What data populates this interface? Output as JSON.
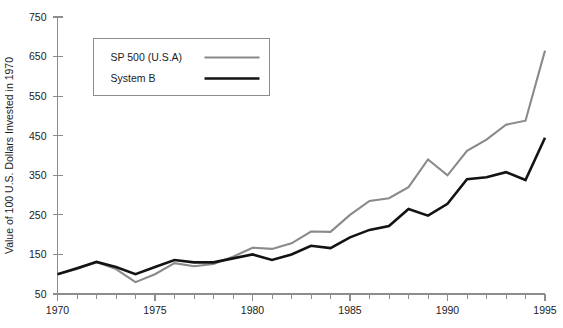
{
  "chart_data": {
    "type": "line",
    "title": "",
    "xlabel": "",
    "ylabel": "Value of 100 U.S. Dollars Invested in 1970",
    "xlim": [
      1970,
      1995
    ],
    "ylim": [
      50,
      750
    ],
    "ytick_values": [
      50,
      150,
      250,
      350,
      450,
      550,
      650,
      750
    ],
    "ytick_labels": [
      "50",
      "150",
      "250",
      "350",
      "450",
      "550",
      "650",
      "750"
    ],
    "xtick_values": [
      1970,
      1975,
      1980,
      1985,
      1990,
      1995
    ],
    "xtick_labels": [
      "1970",
      "1975",
      "1980",
      "1985",
      "1990",
      "1995"
    ],
    "x_minor_tick_step": 1,
    "grid": false,
    "legend_position": "upper-left-inset",
    "x": [
      1970,
      1971,
      1972,
      1973,
      1974,
      1975,
      1976,
      1977,
      1978,
      1979,
      1980,
      1981,
      1982,
      1983,
      1984,
      1985,
      1986,
      1987,
      1988,
      1989,
      1990,
      1991,
      1992,
      1993,
      1994,
      1995
    ],
    "series": [
      {
        "name": "SP 500 (U.S.A)",
        "color": "#8a8a8a",
        "line_width": 2.1,
        "values": [
          100,
          113,
          131,
          113,
          80,
          100,
          128,
          120,
          126,
          144,
          167,
          164,
          178,
          208,
          207,
          250,
          285,
          292,
          320,
          390,
          350,
          412,
          440,
          478,
          488,
          665
        ]
      },
      {
        "name": "System B",
        "color": "#131313",
        "line_width": 2.6,
        "values": [
          100,
          115,
          131,
          118,
          100,
          118,
          136,
          130,
          130,
          140,
          150,
          136,
          150,
          172,
          166,
          193,
          212,
          222,
          265,
          248,
          278,
          340,
          345,
          358,
          338,
          445
        ]
      }
    ]
  },
  "legend": {
    "entries": [
      {
        "label": "SP 500 (U.S.A)",
        "color": "#8a8a8a",
        "line_width": 2.1
      },
      {
        "label": "System B",
        "color": "#131313",
        "line_width": 2.6
      }
    ]
  },
  "caption": {
    "text": ""
  }
}
